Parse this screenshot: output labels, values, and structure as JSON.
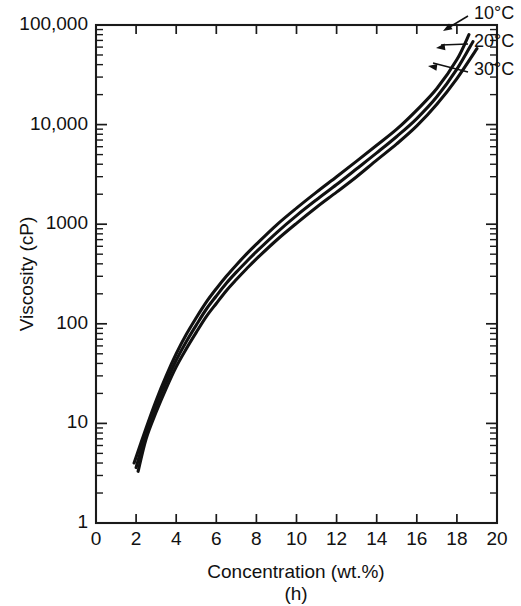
{
  "chart_data": {
    "type": "line",
    "title": "",
    "panel_label": "(h)",
    "xlabel": "Concentration  (wt.%)",
    "ylabel": "Viscosity  (cP)",
    "xlim": [
      0,
      20
    ],
    "ylim": [
      1,
      100000
    ],
    "yscale": "log",
    "xscale": "linear",
    "grid": false,
    "legend_position": "inline-right-annotations",
    "xticks": [
      0,
      2,
      4,
      6,
      8,
      10,
      12,
      14,
      16,
      18,
      20
    ],
    "xtick_labels": [
      "0",
      "2",
      "4",
      "6",
      "8",
      "10",
      "12",
      "14",
      "16",
      "18",
      "20"
    ],
    "yticks": [
      1,
      10,
      100,
      1000,
      10000,
      100000
    ],
    "ytick_labels": [
      "1",
      "10",
      "100",
      "1000",
      "10,000",
      "100,000"
    ],
    "y_minor_ticks": true,
    "axis_color": "#1a1a1a",
    "curve_color": "#111111",
    "series": [
      {
        "name": "10°C",
        "label": "10°C",
        "x": [
          1.9,
          2.5,
          3.0,
          3.5,
          4.0,
          4.5,
          5.0,
          5.5,
          6.0,
          6.5,
          7.0,
          7.5,
          8.0,
          9.0,
          10.0,
          11.0,
          12.0,
          13.0,
          14.0,
          15.0,
          16.0,
          17.0,
          18.0,
          18.6
        ],
        "y": [
          4.0,
          9.0,
          17.0,
          30.0,
          50.0,
          78.0,
          115.0,
          165.0,
          225.0,
          300.0,
          390.0,
          500.0,
          630.0,
          980.0,
          1450.0,
          2100.0,
          3000.0,
          4300.0,
          6200.0,
          9000.0,
          14000.0,
          23000.0,
          45000.0,
          80000.0
        ]
      },
      {
        "name": "20°C",
        "label": "20°C",
        "x": [
          2.0,
          2.5,
          3.0,
          3.5,
          4.0,
          4.5,
          5.0,
          5.5,
          6.0,
          6.5,
          7.0,
          7.5,
          8.0,
          9.0,
          10.0,
          11.0,
          12.0,
          13.0,
          14.0,
          15.0,
          16.0,
          17.0,
          18.0,
          18.8
        ],
        "y": [
          3.6,
          8.0,
          15.0,
          26.0,
          43.0,
          66.0,
          97.0,
          140.0,
          190.0,
          255.0,
          330.0,
          420.0,
          530.0,
          820.0,
          1220.0,
          1760.0,
          2500.0,
          3600.0,
          5200.0,
          7600.0,
          11500.0,
          19000.0,
          36000.0,
          68000.0
        ]
      },
      {
        "name": "30°C",
        "label": "30°C",
        "x": [
          2.1,
          2.5,
          3.0,
          3.5,
          4.0,
          4.5,
          5.0,
          5.5,
          6.0,
          6.5,
          7.0,
          7.5,
          8.0,
          9.0,
          10.0,
          11.0,
          12.0,
          13.0,
          14.0,
          15.0,
          16.0,
          17.0,
          18.0,
          19.0
        ],
        "y": [
          3.3,
          7.0,
          13.0,
          22.5,
          37.0,
          56.0,
          82.0,
          118.0,
          160.0,
          215.0,
          278.0,
          355.0,
          448.0,
          690.0,
          1020.0,
          1480.0,
          2100.0,
          3000.0,
          4400.0,
          6400.0,
          9700.0,
          16000.0,
          29000.0,
          58000.0
        ]
      }
    ],
    "annotations": [
      {
        "text": "10°C",
        "points_to_series": "10°C"
      },
      {
        "text": "20°C",
        "points_to_series": "20°C"
      },
      {
        "text": "30°C",
        "points_to_series": "30°C"
      }
    ]
  }
}
